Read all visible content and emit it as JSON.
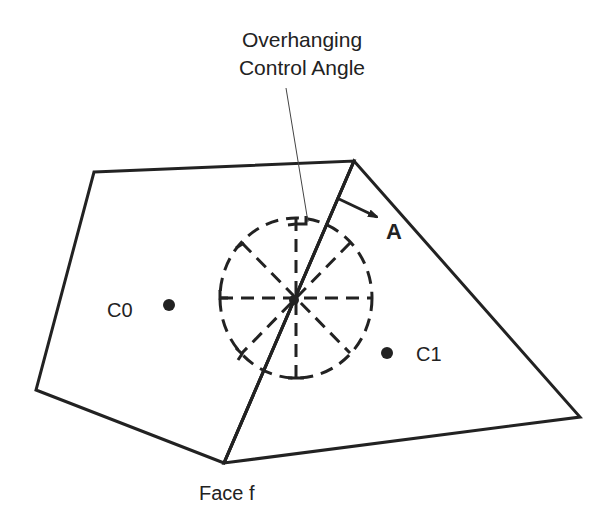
{
  "title": {
    "line1": "Overhanging",
    "line2": "Control Angle"
  },
  "labels": {
    "cell0": "C0",
    "cell1": "C1",
    "face": "Face f",
    "direction": "A"
  },
  "colors": {
    "stroke": "#222222",
    "background": "#ffffff"
  },
  "geometry": {
    "left_cell_vertices": [
      [
        94,
        172
      ],
      [
        354,
        161
      ],
      [
        224,
        463
      ],
      [
        36,
        390
      ]
    ],
    "right_cell_vertices": [
      [
        354,
        161
      ],
      [
        580,
        417
      ],
      [
        224,
        463
      ]
    ],
    "face_line": [
      [
        354,
        161
      ],
      [
        224,
        463
      ]
    ],
    "c0_point": [
      169,
      305
    ],
    "c1_point": [
      387,
      353
    ],
    "control_circle": {
      "cx": 296,
      "cy": 298,
      "r": 77,
      "spokes": 8
    },
    "leader_line": [
      [
        286,
        88
      ],
      [
        308,
        222
      ]
    ]
  }
}
